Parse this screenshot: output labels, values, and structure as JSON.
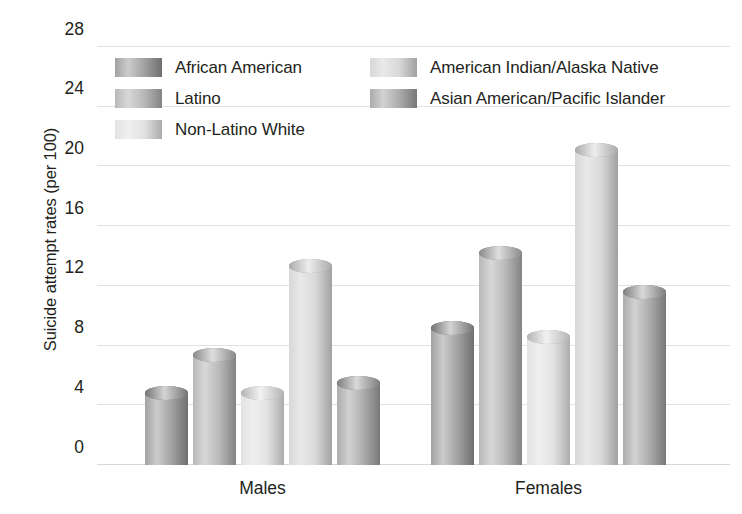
{
  "chart_data": {
    "type": "bar",
    "title": "",
    "xlabel": "",
    "ylabel": "Suicide attempt rates (per 100)",
    "categories": [
      "Males",
      "Females"
    ],
    "ylim": [
      0,
      28
    ],
    "yticks": [
      0,
      4,
      8,
      12,
      16,
      20,
      24,
      28
    ],
    "ytick_labels": [
      "0",
      "4",
      "8",
      "12",
      "16",
      "20",
      "24",
      "28"
    ],
    "grid": true,
    "legend_position": "upper-left-inside",
    "series": [
      {
        "name": "African American",
        "color": "#8e8e8e",
        "values": [
          4.8,
          9.2
        ]
      },
      {
        "name": "Latino",
        "color": "#a8a8a8",
        "values": [
          7.4,
          14.2
        ]
      },
      {
        "name": "Non-Latino White",
        "color": "#dcdcdc",
        "values": [
          4.8,
          8.6
        ]
      },
      {
        "name": "American Indian/Alaska Native",
        "color": "#cfcfcf",
        "values": [
          13.3,
          21.1
        ]
      },
      {
        "name": "Asian American/Pacific Islander",
        "color": "#9a9a9a",
        "values": [
          5.5,
          11.6
        ]
      }
    ]
  },
  "legend": {
    "columns": [
      [
        {
          "label": "African American",
          "color": "#8e8e8e"
        },
        {
          "label": "Latino",
          "color": "#a8a8a8"
        },
        {
          "label": "Non-Latino White",
          "color": "#dcdcdc"
        }
      ],
      [
        {
          "label": "American Indian/Alaska Native",
          "color": "#cfcfcf"
        },
        {
          "label": "Asian American/Pacific Islander",
          "color": "#9a9a9a"
        }
      ]
    ]
  },
  "axis": {
    "y_title": "Suicide attempt rates (per 100)",
    "x_labels": [
      "Males",
      "Females"
    ]
  },
  "colors": {
    "gridline": "#e2e2e2",
    "text": "#231f20",
    "background": "#ffffff"
  },
  "caption": ""
}
